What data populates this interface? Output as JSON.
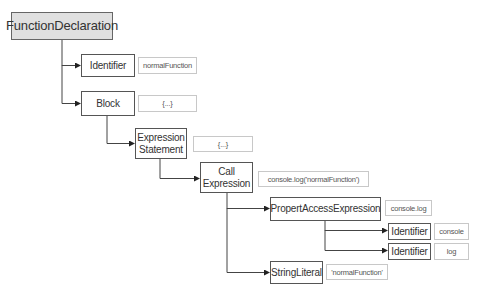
{
  "diagram": {
    "nodes": [
      {
        "id": "fd",
        "label": "FunctionDeclaration",
        "value": null
      },
      {
        "id": "id1",
        "label": "Identifier",
        "value": "normalFunction"
      },
      {
        "id": "blk",
        "label": "Block",
        "value": "{...}"
      },
      {
        "id": "es",
        "label": "Expression Statement",
        "value": "{...}"
      },
      {
        "id": "ce",
        "label": "Call Expression",
        "value": "console.log('normalFunction')"
      },
      {
        "id": "pae",
        "label": "PropertAccessExpression",
        "value": "console.log"
      },
      {
        "id": "id2",
        "label": "Identifier",
        "value": "console"
      },
      {
        "id": "id3",
        "label": "Identifier",
        "value": "log"
      },
      {
        "id": "sl",
        "label": "StringLiteral",
        "value": "'normalFunction'"
      }
    ],
    "edges": [
      [
        "fd",
        "id1"
      ],
      [
        "fd",
        "blk"
      ],
      [
        "blk",
        "es"
      ],
      [
        "es",
        "ce"
      ],
      [
        "ce",
        "pae"
      ],
      [
        "ce",
        "sl"
      ],
      [
        "pae",
        "id2"
      ],
      [
        "pae",
        "id3"
      ]
    ],
    "colors": {
      "root_fill": "#e0e0e0",
      "node_border": "#555555",
      "value_border": "#c8c8c8",
      "edge": "#333333"
    }
  }
}
